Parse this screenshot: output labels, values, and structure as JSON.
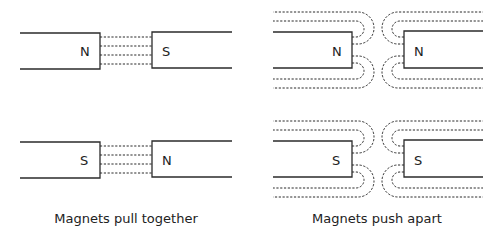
{
  "panels": [
    {
      "id": "attract-ns",
      "caption_group": "attract",
      "left_pole": "N",
      "right_pole": "S",
      "interaction": "attract"
    },
    {
      "id": "attract-sn",
      "caption_group": "attract",
      "left_pole": "S",
      "right_pole": "N",
      "interaction": "attract"
    },
    {
      "id": "repel-nn",
      "caption_group": "repel",
      "left_pole": "N",
      "right_pole": "N",
      "interaction": "repel"
    },
    {
      "id": "repel-ss",
      "caption_group": "repel",
      "left_pole": "S",
      "right_pole": "S",
      "interaction": "repel"
    }
  ],
  "captions": {
    "attract": "Magnets pull together",
    "repel": "Magnets push apart"
  },
  "colors": {
    "line": "#2b2b2b",
    "text": "#222222",
    "background": "#ffffff"
  }
}
